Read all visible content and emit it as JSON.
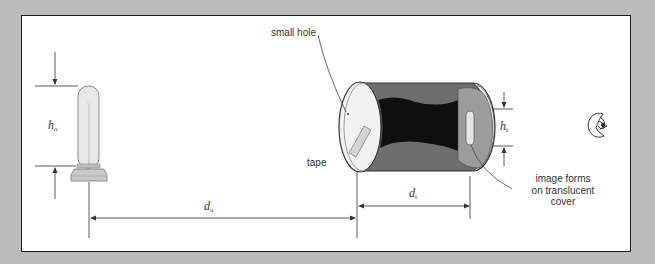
{
  "figure": {
    "labels": {
      "small_hole": "small hole",
      "tape": "tape",
      "image_note_line1": "image forms",
      "image_note_line2": "on translucent",
      "image_note_line3": "cover",
      "object_height": {
        "symbol": "h",
        "subscript": "o"
      },
      "image_height": {
        "symbol": "h",
        "subscript": "i"
      },
      "object_distance": {
        "symbol": "d",
        "subscript": "o"
      },
      "image_distance": {
        "symbol": "d",
        "subscript": "i"
      }
    },
    "elements": {
      "object": "light-bulb",
      "camera": "cylindrical-can-pinhole-camera",
      "viewer": "eye-icon"
    },
    "colors": {
      "background": "#bcbcbc",
      "panel": "#ffffff",
      "border": "#1a1a1a",
      "can_dark": "#111111",
      "can_gray": "#6e6e6e",
      "cover": "#9a9a9a"
    }
  }
}
